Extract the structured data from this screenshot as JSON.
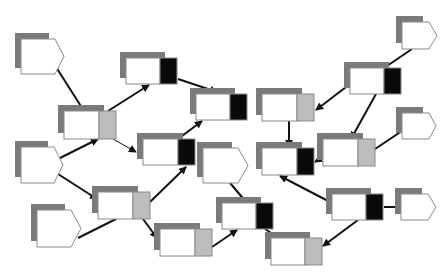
{
  "canvas": {
    "width": 448,
    "height": 277,
    "background": "#ffffff"
  },
  "colors": {
    "shadow": "#7a7a7a",
    "box_fill": "#ffffff",
    "box_stroke": "#8a8a8a",
    "port_black": "#0a0a0a",
    "port_gray": "#bdbdbd",
    "edge": "#111111"
  },
  "shadow_offset": [
    -6,
    -6
  ],
  "pentagons": [
    {
      "id": "A",
      "x": 21,
      "y": 39,
      "w": 43,
      "h": 35
    },
    {
      "id": "S",
      "x": 21,
      "y": 147,
      "w": 42,
      "h": 36
    },
    {
      "id": "T",
      "x": 37,
      "y": 210,
      "w": 44,
      "h": 37
    },
    {
      "id": "H",
      "x": 203,
      "y": 148,
      "w": 45,
      "h": 35
    },
    {
      "id": "O",
      "x": 402,
      "y": 22,
      "w": 35,
      "h": 27
    },
    {
      "id": "M",
      "x": 402,
      "y": 113,
      "w": 34,
      "h": 26
    },
    {
      "id": "Q",
      "x": 401,
      "y": 194,
      "w": 35,
      "h": 26
    }
  ],
  "nodes": [
    {
      "id": "B",
      "x": 64,
      "y": 111,
      "w": 35,
      "h": 28,
      "port": "gray"
    },
    {
      "id": "C",
      "x": 126,
      "y": 58,
      "w": 34,
      "h": 26,
      "port": "black"
    },
    {
      "id": "D",
      "x": 196,
      "y": 94,
      "w": 34,
      "h": 26,
      "port": "black"
    },
    {
      "id": "E",
      "x": 143,
      "y": 139,
      "w": 35,
      "h": 26,
      "port": "black"
    },
    {
      "id": "F",
      "x": 98,
      "y": 192,
      "w": 35,
      "h": 27,
      "port": "gray"
    },
    {
      "id": "G",
      "x": 160,
      "y": 229,
      "w": 35,
      "h": 27,
      "port": "gray"
    },
    {
      "id": "I",
      "x": 222,
      "y": 203,
      "w": 34,
      "h": 26,
      "port": "black"
    },
    {
      "id": "J",
      "x": 262,
      "y": 94,
      "w": 35,
      "h": 27,
      "port": "gray"
    },
    {
      "id": "K",
      "x": 262,
      "y": 148,
      "w": 35,
      "h": 27,
      "port": "black"
    },
    {
      "id": "L",
      "x": 350,
      "y": 68,
      "w": 34,
      "h": 26,
      "port": "black"
    },
    {
      "id": "N",
      "x": 323,
      "y": 139,
      "w": 35,
      "h": 27,
      "port": "gray"
    },
    {
      "id": "P",
      "x": 332,
      "y": 194,
      "w": 34,
      "h": 26,
      "port": "black"
    },
    {
      "id": "R",
      "x": 271,
      "y": 238,
      "w": 34,
      "h": 27,
      "port": "gray"
    }
  ],
  "port_width": 17,
  "edges": [
    {
      "from": "A",
      "x1": 56,
      "y1": 67,
      "x2": 84,
      "y2": 111,
      "arrow": false
    },
    {
      "from": "B",
      "x1": 108,
      "y1": 111,
      "x2": 149,
      "y2": 85,
      "arrow": true
    },
    {
      "from": "B",
      "x1": 113,
      "y1": 139,
      "x2": 136,
      "y2": 152,
      "arrow": true,
      "thin": true
    },
    {
      "from": "S",
      "x1": 60,
      "y1": 158,
      "x2": 98,
      "y2": 139,
      "arrow": true
    },
    {
      "from": "S",
      "x1": 58,
      "y1": 174,
      "x2": 97,
      "y2": 199,
      "arrow": true
    },
    {
      "from": "T",
      "x1": 78,
      "y1": 238,
      "x2": 116,
      "y2": 219,
      "arrow": false
    },
    {
      "from": "C",
      "x1": 178,
      "y1": 79,
      "x2": 217,
      "y2": 92,
      "arrow": true
    },
    {
      "from": "E",
      "x1": 178,
      "y1": 139,
      "x2": 202,
      "y2": 121,
      "arrow": true
    },
    {
      "from": "F",
      "x1": 150,
      "y1": 202,
      "x2": 186,
      "y2": 167,
      "arrow": true
    },
    {
      "from": "F",
      "x1": 143,
      "y1": 219,
      "x2": 157,
      "y2": 238,
      "arrow": true
    },
    {
      "from": "G",
      "x1": 212,
      "y1": 247,
      "x2": 237,
      "y2": 230,
      "arrow": true
    },
    {
      "from": "H",
      "x1": 230,
      "y1": 183,
      "x2": 247,
      "y2": 203,
      "arrow": false
    },
    {
      "from": "I",
      "x1": 265,
      "y1": 229,
      "x2": 279,
      "y2": 238,
      "arrow": false
    },
    {
      "from": "O",
      "x1": 412,
      "y1": 49,
      "x2": 384,
      "y2": 68,
      "arrow": false
    },
    {
      "from": "L",
      "x1": 350,
      "y1": 84,
      "x2": 316,
      "y2": 110,
      "arrow": true
    },
    {
      "from": "L",
      "x1": 376,
      "y1": 94,
      "x2": 351,
      "y2": 139,
      "arrow": true
    },
    {
      "from": "J",
      "x1": 289,
      "y1": 121,
      "x2": 289,
      "y2": 147,
      "arrow": true
    },
    {
      "from": "M",
      "x1": 402,
      "y1": 131,
      "x2": 375,
      "y2": 149,
      "arrow": false
    },
    {
      "from": "N",
      "x1": 323,
      "y1": 157,
      "x2": 315,
      "y2": 162,
      "arrow": true
    },
    {
      "from": "P",
      "x1": 332,
      "y1": 203,
      "x2": 280,
      "y2": 176,
      "arrow": true
    },
    {
      "from": "P",
      "x1": 358,
      "y1": 220,
      "x2": 323,
      "y2": 246,
      "arrow": true
    },
    {
      "from": "P",
      "x1": 384,
      "y1": 207,
      "x2": 401,
      "y2": 207,
      "arrow": false
    }
  ]
}
